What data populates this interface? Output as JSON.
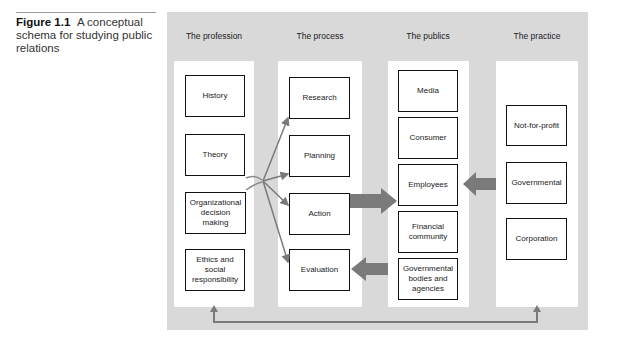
{
  "caption": {
    "label": "Figure 1.1",
    "text": "A conceptual schema for studying public relations"
  },
  "columns": [
    {
      "header": "The profession",
      "items": [
        "History",
        "Theory",
        "Organizational decision making",
        "Ethics and social responsibility"
      ]
    },
    {
      "header": "The process",
      "items": [
        "Research",
        "Planning",
        "Action",
        "Evaluation"
      ]
    },
    {
      "header": "The publics",
      "items": [
        "Media",
        "Consumer",
        "Employees",
        "Financial community",
        "Governmental bodies and agencies"
      ]
    },
    {
      "header": "The practice",
      "items": [
        "Not-for-profit",
        "Governmental",
        "Corporation"
      ]
    }
  ],
  "connections": [
    {
      "from": "Theory / Organizational decision making",
      "to": [
        "Research",
        "Planning",
        "Action",
        "Evaluation"
      ],
      "style": "thin-arrows"
    },
    {
      "from": "Action",
      "to": "Employees",
      "style": "thick-arrow"
    },
    {
      "from": "Governmental bodies and agencies",
      "to": "Evaluation",
      "style": "thick-arrow"
    },
    {
      "from": "Governmental (practice)",
      "to": "Employees",
      "style": "thick-arrow"
    },
    {
      "from": "bottom feedback line",
      "to": [
        "The profession",
        "The practice"
      ],
      "style": "double-ended-arrow"
    }
  ],
  "colors": {
    "panel": "#d9d9d9",
    "column": "#ffffff",
    "arrow": "#7a7a7a",
    "box_border": "#111111"
  }
}
